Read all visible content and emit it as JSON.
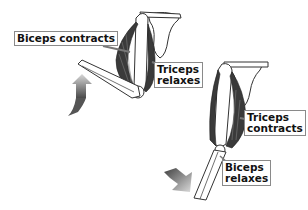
{
  "diagram": {
    "type": "anatomy",
    "panels": [
      {
        "name": "arm-flexed",
        "arrow": "up",
        "labels": [
          {
            "id": "biceps-contracts",
            "lines": [
              "Biceps contracts"
            ]
          },
          {
            "id": "triceps-relaxes",
            "lines": [
              "Triceps",
              "relaxes"
            ]
          }
        ]
      },
      {
        "name": "arm-extended",
        "arrow": "down",
        "labels": [
          {
            "id": "triceps-contracts",
            "lines": [
              "Triceps",
              "contracts"
            ]
          },
          {
            "id": "biceps-relaxes",
            "lines": [
              "Biceps",
              "relaxes"
            ]
          }
        ]
      }
    ]
  },
  "labels": {
    "biceps_contracts": "Biceps contracts",
    "triceps_relaxes_1": "Triceps",
    "triceps_relaxes_2": "relaxes",
    "triceps_contracts_1": "Triceps",
    "triceps_contracts_2": "contracts",
    "biceps_relaxes_1": "Biceps",
    "biceps_relaxes_2": "relaxes"
  },
  "colors": {
    "muscle": "#3a3a3a",
    "bone_outline": "#333333",
    "arrow_dark": "#4a4a4a",
    "arrow_light": "#d8d8d8"
  }
}
